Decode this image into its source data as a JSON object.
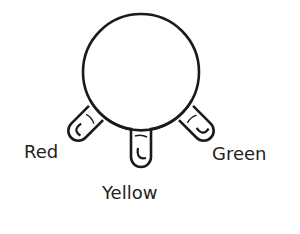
{
  "diagram": {
    "type": "traffic-light-style indicator: circular body with three lamp lobes",
    "stroke_color": "#1a1a1a",
    "background": "#ffffff",
    "body": {
      "shape": "circle",
      "cx": 141,
      "cy": 72,
      "r": 58
    },
    "lamps": [
      {
        "id": "red",
        "label": "Red",
        "angle_deg": 135
      },
      {
        "id": "yellow",
        "label": "Yellow",
        "angle_deg": 90
      },
      {
        "id": "green",
        "label": "Green",
        "angle_deg": 45
      }
    ]
  },
  "labels": {
    "red": "Red",
    "yellow": "Yellow",
    "green": "Green"
  }
}
